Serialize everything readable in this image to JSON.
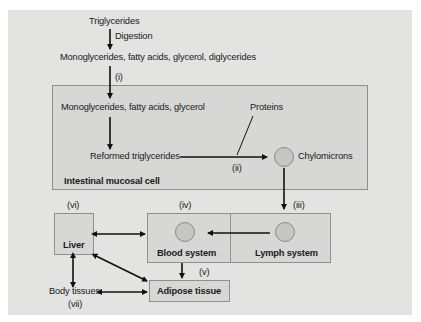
{
  "diagram": {
    "nodes": {
      "triglycerides": "Triglycerides",
      "digestion": "Digestion",
      "digestion_products": "Monoglycerides, fatty acids, glycerol, diglycerides",
      "step_i": "(i)",
      "absorbed_products": "Monoglycerides, fatty acids, glycerol",
      "proteins": "Proteins",
      "reformed_triglycerides": "Reformed triglycerides",
      "step_ii": "(ii)",
      "chylomicrons": "Chylomicrons",
      "intestinal_cell": "Intestinal mucosal cell",
      "step_iii": "(iii)",
      "step_iv": "(iv)",
      "step_v": "(v)",
      "step_vi": "(vi)",
      "step_vii": "(vii)",
      "liver": "Liver",
      "blood_system": "Blood system",
      "lymph_system": "Lymph system",
      "adipose_tissue": "Adipose tissue",
      "body_tissues": "Body tissues"
    },
    "colors": {
      "background": "#e3e3e1",
      "box_fill": "#d7d7d5",
      "box_border": "#8f8f8f",
      "circle_fill": "#c6c6c4",
      "arrow": "#111111"
    }
  }
}
